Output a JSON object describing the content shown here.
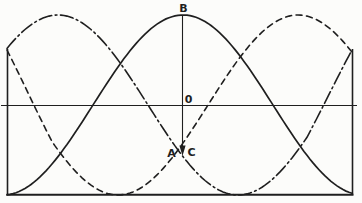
{
  "figure": {
    "background": "#fcfcfa",
    "ink": "#1f1f1f"
  },
  "chart_data": {
    "type": "line",
    "title": "",
    "x_axis": {
      "label": "",
      "ticks": []
    },
    "y_axis": {
      "label": "",
      "ticks": [
        "0"
      ]
    },
    "series": [
      {
        "name": "phase B",
        "style": "solid",
        "amplitude": 1,
        "peak_at_deg": 176,
        "period_deg": 360
      },
      {
        "name": "phase A",
        "style": "dashed",
        "amplitude": 1,
        "peak_at_deg": 291,
        "period_deg": 360
      },
      {
        "name": "phase C",
        "style": "dash-dot",
        "amplitude": 1,
        "peak_at_deg": 51,
        "period_deg": 360
      }
    ],
    "annotations": [
      "B",
      "0",
      "A",
      "C"
    ]
  },
  "plot": {
    "width": 362,
    "height": 203,
    "x_min": 7,
    "x_max": 352,
    "axis_y": 105,
    "amplitude_px": 90,
    "deg_per_px": 1,
    "blend_px": 45,
    "sample_step_px": 3,
    "curves": [
      {
        "name": "curve-phase-b",
        "dash": "",
        "peak_x": 183,
        "width": 1.7
      },
      {
        "name": "curve-phase-a",
        "dash": "6 4.5",
        "peak_x": 298,
        "width": 1.6,
        "pin_start": [
          7,
          50
        ]
      },
      {
        "name": "curve-phase-c",
        "dash": "13 3.5 1.8 3.5",
        "peak_x": 58,
        "width": 1.6,
        "pin_end": [
          352,
          50
        ]
      }
    ],
    "frame_lines": [
      {
        "name": "x-axis-line",
        "x1": 1,
        "y1": 105.5,
        "x2": 357,
        "y2": 105.5,
        "width": 1.2
      },
      {
        "name": "left-border-line",
        "x1": 7.5,
        "y1": 49,
        "x2": 7.5,
        "y2": 194.5,
        "width": 1.6
      },
      {
        "name": "right-border-line",
        "x1": 352.5,
        "y1": 49,
        "x2": 352.5,
        "y2": 194.5,
        "width": 1.6
      },
      {
        "name": "bottom-border-line",
        "x1": 6.5,
        "y1": 194.8,
        "x2": 353.5,
        "y2": 194.8,
        "width": 2
      }
    ],
    "marker": {
      "line": {
        "x": 182.5,
        "y1": 15,
        "y2": 146,
        "width": 1.1
      },
      "arrow_points": "179.4,145.5 185.6,145.5 182.5,156"
    },
    "labels": [
      {
        "name": "label-b",
        "text": "B",
        "x": 183.5,
        "y": 12
      },
      {
        "name": "label-zero",
        "text": "0",
        "x": 188.5,
        "y": 103
      },
      {
        "name": "label-a",
        "text": "A",
        "x": 171.5,
        "y": 157
      },
      {
        "name": "label-c",
        "text": "C",
        "x": 191.5,
        "y": 156
      }
    ],
    "label_font_px": 11
  }
}
